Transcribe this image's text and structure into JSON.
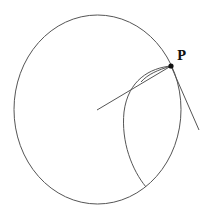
{
  "diagram": {
    "point_label": "P",
    "colors": {
      "stroke": "#555555",
      "point": "#111111",
      "background": "#ffffff"
    },
    "outer_circle": {
      "cx": 97.5,
      "cy": 109.5,
      "rx": 83.5,
      "ry": 94.5
    },
    "point_P": {
      "x": 171,
      "y": 66
    },
    "radial_line": {
      "x1": 97,
      "y1": 110,
      "x2": 171,
      "y2": 66
    },
    "tangent_line": {
      "x1": 171,
      "y1": 66,
      "x2": 199,
      "y2": 130
    },
    "inner_arc": {
      "start": [
        171,
        66
      ],
      "end": [
        146,
        187
      ]
    }
  }
}
